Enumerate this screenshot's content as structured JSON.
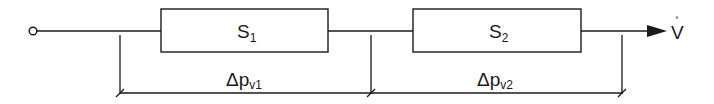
{
  "diagram": {
    "type": "series-resistance flow diagram",
    "elements": [
      {
        "id": "S1",
        "label": "S",
        "subscript": "1"
      },
      {
        "id": "S2",
        "label": "S",
        "subscript": "2"
      }
    ],
    "dimensions": [
      {
        "label": "Δp",
        "subscript": "v1",
        "from": "left-tap",
        "to": "middle-tap"
      },
      {
        "label": "Δp",
        "subscript": "v2",
        "from": "middle-tap",
        "to": "right-tap"
      }
    ],
    "flow": {
      "label": "V",
      "dot": "˚",
      "description": "volume flow rate (V-dot)"
    },
    "colors": {
      "stroke": "#1a1a1a",
      "background": "#ffffff"
    }
  }
}
